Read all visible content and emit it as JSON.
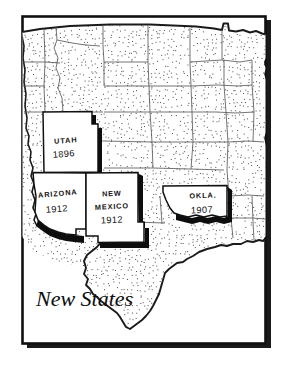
{
  "figure": {
    "kind": "map-illustration",
    "caption": "New States",
    "frame": {
      "border_color": "#111111",
      "shadow_color": "#1a1a1a",
      "fill": "#ffffff"
    },
    "palette": {
      "ink": "#111111",
      "stipple_dot": "#4a4a4a",
      "boundary_line": "#5a5a5a",
      "coast_line": "#1a1a1a",
      "highlight_fill": "#ffffff",
      "highlight_shadow": "#0d0d0d",
      "page_background": "#ffffff"
    },
    "region_label": "Western and south-central United States",
    "highlighted_states": [
      {
        "id": "utah",
        "name": "UTAH",
        "year": "1896",
        "name_x": 66,
        "name_y": 142,
        "year_x": 65,
        "year_y": 155
      },
      {
        "id": "arizona",
        "name": "ARIZONA",
        "year": "1912",
        "name_x": 57,
        "name_y": 195,
        "year_x": 56,
        "year_y": 210
      },
      {
        "id": "new-mexico",
        "name": "NEW",
        "year": "1912",
        "name_x": 112,
        "name_y": 195,
        "year_x": 112,
        "year_y": 219,
        "name2": "MEXICO",
        "name2_x": 112,
        "name2_y": 207
      },
      {
        "id": "oklahoma",
        "name": "OKLA.",
        "year": "1907",
        "name_x": 203,
        "name_y": 197,
        "year_x": 202,
        "year_y": 212
      }
    ],
    "stipple": {
      "dots": 2600,
      "seed": 1337,
      "dot_size": 1.0,
      "description": "fine random stipple texture over unhighlighted states"
    }
  }
}
